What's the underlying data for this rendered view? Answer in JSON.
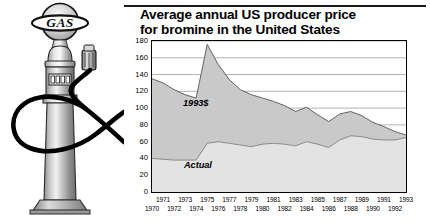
{
  "illustration": {
    "name": "vintage-gas-pump",
    "globe_text": "GAS",
    "parts": [
      "globe-sign",
      "pump-body",
      "display-window",
      "nozzle",
      "hose",
      "base"
    ]
  },
  "figure": {
    "title_line1": "Average annual US producer price",
    "title_line2": "for bromine in the United States",
    "units_label": "(cents/kg)",
    "series_label_real": "1993$",
    "series_label_nominal": "Actual"
  },
  "colors": {
    "ink": "#000000",
    "real_fill": "#c9c9c9",
    "nominal_fill": "#e3e3e3",
    "gridline": "#808080",
    "frame": "#000000"
  },
  "chart_data": {
    "type": "area",
    "title": "Average annual US producer price for bromine in the United States",
    "xlabel": "",
    "ylabel": "(cents/kg)",
    "ylim": [
      0,
      180
    ],
    "ytick_step": 20,
    "yticks": [
      0,
      20,
      40,
      60,
      80,
      100,
      120,
      140,
      160,
      180
    ],
    "grid": true,
    "legend": "in-plot annotations",
    "x": [
      1970,
      1971,
      1972,
      1973,
      1974,
      1975,
      1976,
      1977,
      1978,
      1979,
      1980,
      1981,
      1982,
      1983,
      1984,
      1985,
      1986,
      1987,
      1988,
      1989,
      1990,
      1991,
      1992,
      1993
    ],
    "xtick_labels_upper": [
      "1971",
      "1973",
      "1975",
      "1977",
      "1979",
      "1981",
      "1983",
      "1985",
      "1987",
      "1989",
      "1991",
      "1993"
    ],
    "xtick_labels_lower": [
      "1970",
      "1972",
      "1974",
      "1976",
      "1978",
      "1980",
      "1982",
      "1984",
      "1986",
      "1988",
      "1990",
      "1992"
    ],
    "series": [
      {
        "name": "1993$",
        "description": "Inflation-adjusted price in constant 1993 dollars",
        "fill": "#c9c9c9",
        "values": [
          135,
          130,
          122,
          116,
          112,
          176,
          152,
          134,
          122,
          116,
          112,
          108,
          103,
          96,
          101,
          92,
          84,
          93,
          96,
          91,
          83,
          78,
          72,
          68
        ]
      },
      {
        "name": "Actual",
        "description": "Nominal price as reported",
        "fill": "#e3e3e3",
        "values": [
          40,
          39,
          38,
          38,
          38,
          58,
          60,
          58,
          56,
          54,
          57,
          58,
          57,
          55,
          60,
          57,
          53,
          62,
          67,
          66,
          63,
          62,
          62,
          65
        ]
      }
    ]
  }
}
